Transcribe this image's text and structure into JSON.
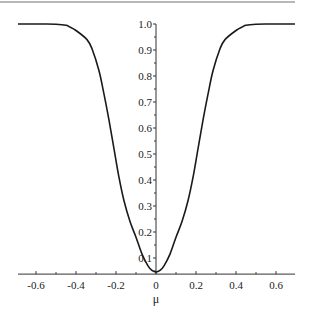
{
  "chart_data": {
    "type": "line",
    "title": "",
    "xlabel": "μ",
    "ylabel": "",
    "xlim": [
      -0.69,
      0.695
    ],
    "ylim": [
      0.038,
      1.0
    ],
    "x_axis_crosses_y_at": 0.038,
    "y_axis_at_x": 0,
    "grid": false,
    "legend": null,
    "x_ticks": [
      -0.6,
      -0.4,
      -0.2,
      0,
      0.2,
      0.4,
      0.6
    ],
    "x_tick_labels": [
      "-0.6",
      "-0.4",
      "-0.2",
      "0",
      "0.2",
      "0.4",
      "0.6"
    ],
    "x_minor_step": 0.1,
    "y_ticks": [
      0.1,
      0.2,
      0.3,
      0.4,
      0.5,
      0.6,
      0.7,
      0.8,
      0.9,
      1.0
    ],
    "y_tick_labels": [
      "0.1",
      "0.2",
      "0.3",
      "0.4",
      "0.5",
      "0.6",
      "0.7",
      "0.8",
      "0.9",
      "1.0"
    ],
    "y_minor_step": 0.05,
    "series": [
      {
        "name": "curve",
        "color": "#1a1a1a",
        "x": [
          -0.69,
          -0.55,
          -0.5,
          -0.45,
          -0.435,
          -0.4,
          -0.345,
          -0.32,
          -0.285,
          -0.26,
          -0.235,
          -0.21,
          -0.185,
          -0.16,
          -0.13,
          -0.1,
          -0.07,
          -0.04,
          -0.02,
          0,
          0.02,
          0.04,
          0.07,
          0.1,
          0.13,
          0.16,
          0.185,
          0.21,
          0.235,
          0.26,
          0.285,
          0.32,
          0.345,
          0.4,
          0.435,
          0.45,
          0.5,
          0.55,
          0.695
        ],
        "y": [
          1.0,
          1.0,
          0.999,
          0.995,
          0.99,
          0.975,
          0.94,
          0.905,
          0.82,
          0.73,
          0.63,
          0.52,
          0.41,
          0.32,
          0.24,
          0.18,
          0.115,
          0.07,
          0.052,
          0.046,
          0.052,
          0.07,
          0.115,
          0.18,
          0.24,
          0.32,
          0.41,
          0.52,
          0.63,
          0.73,
          0.82,
          0.905,
          0.94,
          0.975,
          0.99,
          0.995,
          0.999,
          1.0,
          1.0
        ]
      }
    ]
  },
  "frame": {
    "top_border_color": "#a0a0a0"
  }
}
